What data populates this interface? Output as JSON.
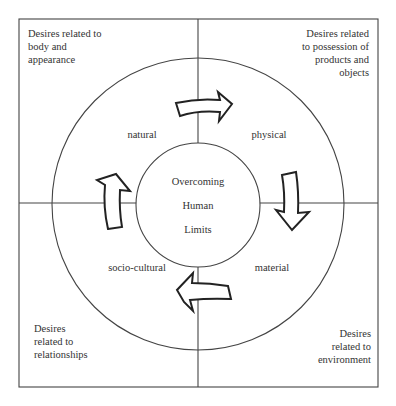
{
  "diagram": {
    "center": {
      "lines": [
        "Overcoming",
        "Human",
        "Limits"
      ]
    },
    "quadrants": {
      "top_left": {
        "lines": [
          "Desires related to",
          "body and",
          "appearance"
        ]
      },
      "top_right": {
        "lines": [
          "Desires related",
          "to possession of",
          "products and",
          "objects"
        ]
      },
      "bottom_left": {
        "lines": [
          "Desires",
          "related to",
          "relationships"
        ]
      },
      "bottom_right": {
        "lines": [
          "Desires",
          "related to",
          "environment"
        ]
      }
    },
    "ring_labels": {
      "natural": "natural",
      "physical": "physical",
      "material": "material",
      "socio_cultural": "socio-cultural"
    },
    "arrows": [
      {
        "from": "natural",
        "to": "physical",
        "direction": "clockwise"
      },
      {
        "from": "physical",
        "to": "material",
        "direction": "clockwise"
      },
      {
        "from": "material",
        "to": "socio-cultural",
        "direction": "clockwise"
      },
      {
        "from": "socio-cultural",
        "to": "natural",
        "direction": "clockwise"
      }
    ],
    "colors": {
      "line": "#444444",
      "text": "#333333",
      "background": "#ffffff"
    }
  }
}
